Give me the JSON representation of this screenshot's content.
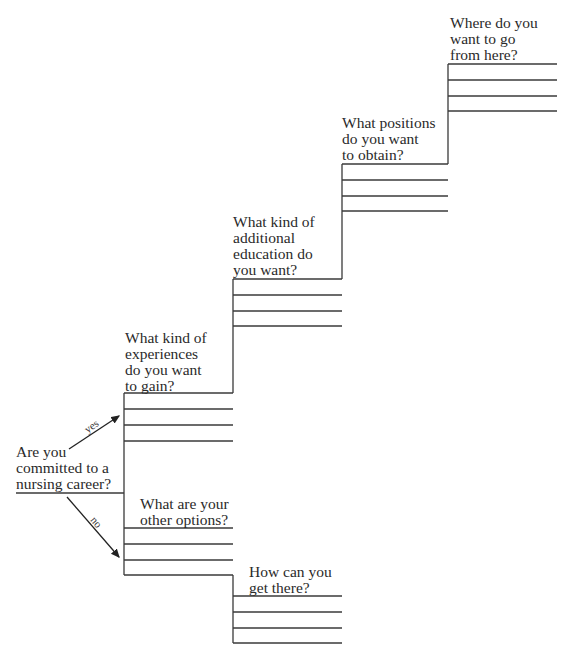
{
  "diagram": {
    "type": "career-staircase-flowchart",
    "start_question": "Are you\ncommitted to a\nnursing career?",
    "branches": {
      "yes_label": "yes",
      "no_label": "no"
    },
    "yes_steps": [
      {
        "question": "What kind of\nexperiences\ndo you want\nto gain?",
        "answer_lines": 3
      },
      {
        "question": "What kind of\nadditional\neducation do\nyou want?",
        "answer_lines": 3
      },
      {
        "question": "What positions\ndo you want\nto obtain?",
        "answer_lines": 3
      },
      {
        "question": "Where do you\nwant to go\nfrom here?",
        "answer_lines": 4
      }
    ],
    "no_steps": [
      {
        "question": "What are your\nother options?",
        "answer_lines": 3
      },
      {
        "question": "How can you\nget there?",
        "answer_lines": 4
      }
    ],
    "line_color": "#3a3a3a"
  }
}
